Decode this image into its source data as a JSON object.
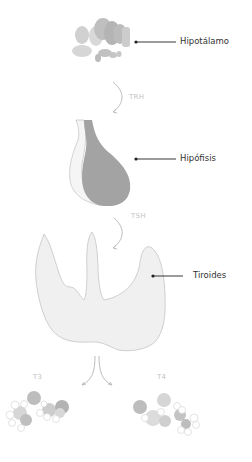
{
  "organs": [
    {
      "name": "Hipotálamo"
    },
    {
      "name": "Hipófisis"
    },
    {
      "name": "Tiroides"
    }
  ],
  "hormones": {
    "trh": "TRH",
    "tsh": "TSH",
    "t3": "T3",
    "t4": "T4"
  },
  "colors": {
    "organ_dark": "#a3a3a3",
    "organ_mid": "#bfbfbf",
    "organ_light": "#ebebeb",
    "outline": "#c8c8c8",
    "arrow": "#bdbdbd",
    "leader_line": "#222222",
    "text": "#333333",
    "hormone_text": "#c4c4c4"
  }
}
